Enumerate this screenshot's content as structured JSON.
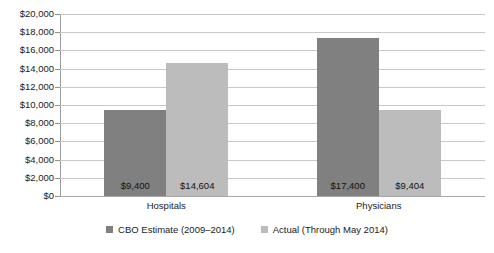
{
  "chart_data": {
    "type": "bar",
    "title": "",
    "subtitle": "",
    "xlabel": "",
    "ylabel": "",
    "categories": [
      "Hospitals",
      "Physicians"
    ],
    "series": [
      {
        "name": "CBO Estimate (2009–2014)",
        "color": "#808080",
        "values": [
          9400,
          17400
        ],
        "labels": [
          "$9,400",
          "$17,400"
        ]
      },
      {
        "name": "Actual (Through May 2014)",
        "color": "#bcbcbc",
        "values": [
          14604,
          9404
        ],
        "labels": [
          "$14,604",
          "$9,404"
        ]
      }
    ],
    "ylim": [
      0,
      20000
    ],
    "ytick_step": 2000,
    "ytick_labels": [
      "$20,000",
      "$18,000",
      "$16,000",
      "$14,000",
      "$12,000",
      "$10,000",
      "$8,000",
      "$6,000",
      "$4,000",
      "$2,000",
      "$0"
    ],
    "ytick_values": [
      20000,
      18000,
      16000,
      14000,
      12000,
      10000,
      8000,
      6000,
      4000,
      2000,
      0
    ],
    "grid": true,
    "grid_axis": "y",
    "legend_position": "bottom",
    "value_labels_inside_bars": true,
    "background_color": "#ffffff",
    "grid_color": "#c9c9c9",
    "axis_color": "#9a9a9a"
  }
}
